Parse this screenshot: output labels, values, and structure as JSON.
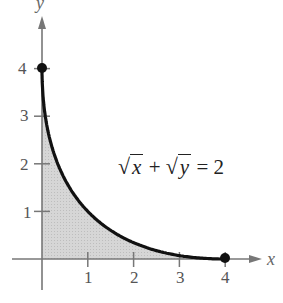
{
  "chart_data": {
    "type": "area",
    "title": "",
    "xlabel": "x",
    "ylabel": "y",
    "xlim": [
      0,
      4
    ],
    "ylim": [
      0,
      4
    ],
    "x_ticks": [
      "1",
      "2",
      "3",
      "4"
    ],
    "y_ticks": [
      "1",
      "2",
      "3",
      "4"
    ],
    "grid": false,
    "legend": null,
    "curve_equation": "√x + √y = 2",
    "series": [
      {
        "name": "√x + √y = 2",
        "x": [
          0,
          0.25,
          0.5,
          1,
          1.5,
          2,
          2.5,
          3,
          3.5,
          4
        ],
        "y": [
          4,
          2.25,
          1.67,
          1,
          0.6,
          0.34,
          0.17,
          0.07,
          0.01,
          0
        ]
      }
    ],
    "endpoints": [
      [
        0,
        4
      ],
      [
        4,
        0
      ]
    ],
    "shaded_region": "area under curve from x=0 to x=4",
    "colors": {
      "curve": "#111111",
      "fill": "#d4d4d4",
      "axes": "#777777"
    }
  },
  "labels": {
    "x_axis": "x",
    "y_axis": "y",
    "x_ticks": [
      "1",
      "2",
      "3",
      "4"
    ],
    "y_ticks": [
      "1",
      "2",
      "3",
      "4"
    ],
    "equation_lhs_radicand_1": "x",
    "equation_plus": "+",
    "equation_lhs_radicand_2": "y",
    "equation_rhs": "= 2"
  }
}
